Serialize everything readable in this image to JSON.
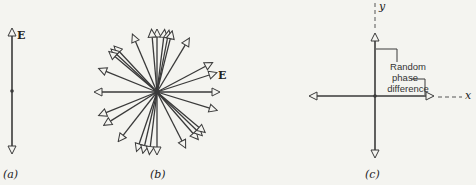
{
  "panels": [
    {
      "id": "a",
      "caption": "(a)",
      "field_label": "E",
      "description": "Linearly polarized wave: E oscillates along a single vertical axis"
    },
    {
      "id": "b",
      "caption": "(b)",
      "field_label": "E",
      "description": "Unpolarized light: E vectors in many random directions",
      "arrow_angles_deg": [
        90,
        95,
        83,
        79,
        76,
        113,
        59,
        133,
        137,
        140,
        158,
        180,
        0,
        28,
        18,
        202,
        212,
        232,
        251,
        257,
        263,
        270,
        297,
        311,
        316,
        320,
        343
      ]
    },
    {
      "id": "c",
      "caption": "(c)",
      "axis_x": "x",
      "axis_y": "y",
      "annotation": "Random phase difference",
      "annotation_lines": [
        "Random",
        "phase",
        "difference"
      ]
    }
  ],
  "colors": {
    "line": "#3a3a3a",
    "background": "#f4f4f0"
  }
}
